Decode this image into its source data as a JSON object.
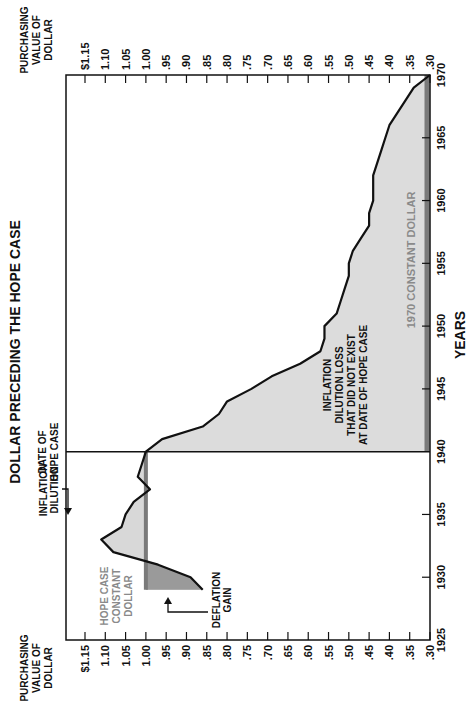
{
  "chart_data": {
    "type": "area",
    "title": "DOLLAR PRECEDING THE HOPE CASE",
    "xlabel": "YEARS",
    "ylabel": "PURCHASING VALUE OF DOLLAR",
    "orientation_note": "rotated 90 degrees; years run along the right edge (1925 bottom to 1970 top), purchasing value runs along top and bottom edges ($1.15 left to .30 right)",
    "year_ticks": [
      "1925",
      "1930",
      "1935",
      "1940",
      "1945",
      "1950",
      "1955",
      "1960",
      "1965",
      "1970"
    ],
    "value_ticks": [
      "$1.15",
      "1.10",
      "1.05",
      "1.00",
      ".95",
      ".90",
      ".85",
      ".80",
      ".75",
      ".70",
      ".65",
      ".60",
      ".55",
      ".50",
      ".45",
      ".40",
      ".35",
      ".30"
    ],
    "xlim": [
      1925,
      1970
    ],
    "ylim": [
      1.15,
      0.3
    ],
    "series": [
      {
        "name": "Purchasing value of dollar",
        "x": [
          1929,
          1930,
          1931,
          1932,
          1933,
          1934,
          1935,
          1936,
          1937,
          1938,
          1939,
          1940,
          1941,
          1942,
          1943,
          1944,
          1945,
          1946,
          1947,
          1948,
          1949,
          1950,
          1951,
          1952,
          1953,
          1954,
          1955,
          1956,
          1957,
          1958,
          1959,
          1960,
          1961,
          1962,
          1963,
          1964,
          1965,
          1966,
          1967,
          1968,
          1969,
          1970
        ],
        "values": [
          0.86,
          0.89,
          0.97,
          1.08,
          1.11,
          1.06,
          1.05,
          1.03,
          0.99,
          1.02,
          1.01,
          1.0,
          0.96,
          0.86,
          0.82,
          0.8,
          0.74,
          0.69,
          0.62,
          0.57,
          0.56,
          0.56,
          0.53,
          0.52,
          0.51,
          0.5,
          0.5,
          0.49,
          0.47,
          0.45,
          0.45,
          0.44,
          0.44,
          0.44,
          0.43,
          0.42,
          0.41,
          0.4,
          0.38,
          0.36,
          0.34,
          0.3
        ]
      }
    ],
    "reference_lines": [
      {
        "name": "Hope case constant dollar",
        "value": 1.0,
        "from": 1929,
        "to": 1940
      },
      {
        "name": "1970 constant dollar",
        "value": 0.3,
        "from": 1940,
        "to": 1970
      },
      {
        "name": "Date of Hope case",
        "year": 1940
      }
    ],
    "annotations": [
      "DATE OF HOPE CASE",
      "INFLATION DILUTION",
      "DEFLATION GAIN",
      "HOPE CASE CONSTANT DOLLAR",
      "INFLATION DILUTION LOSS THAT DID NOT EXIST AT DATE OF HOPE CASE",
      "1970 CONSTANT DOLLAR"
    ]
  },
  "labels": {
    "title": "DOLLAR PRECEDING THE HOPE CASE",
    "axis_top": [
      "PURCHASING",
      "VALUE OF",
      "DOLLAR"
    ],
    "axis_bottom": [
      "PURCHASING",
      "VALUE OF",
      "DOLLAR"
    ],
    "years_label": "YEARS",
    "date_hope": [
      "DATE OF",
      "HOPE CASE"
    ],
    "inflation_dilution": [
      "INFLATION",
      "DILUTION"
    ],
    "deflation_gain": [
      "DEFLATION",
      "GAIN"
    ],
    "hope_constant": [
      "HOPE CASE",
      "CONSTANT",
      "DOLLAR"
    ],
    "loss_text": [
      "INFLATION",
      "DILUTION LOSS",
      "THAT DID NOT EXIST",
      "AT DATE OF HOPE CASE"
    ],
    "constant_1970": "1970 CONSTANT DOLLAR"
  }
}
